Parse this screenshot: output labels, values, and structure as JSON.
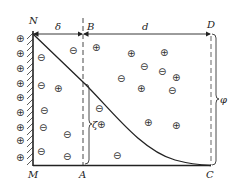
{
  "diagram": {
    "labels": {
      "N": "N",
      "M": "M",
      "A": "A",
      "B": "B",
      "C": "C",
      "D": "D",
      "delta": "δ",
      "d": "d",
      "zeta": "ζ",
      "phi": "φ"
    },
    "symbols": {
      "plus": "⊕",
      "minus": "⊖"
    },
    "colors": {
      "line": "#222222",
      "background": "#ffffff"
    },
    "wall_ions": [
      {
        "x": 20,
        "y": 39
      },
      {
        "x": 20,
        "y": 54
      },
      {
        "x": 20,
        "y": 68
      },
      {
        "x": 20,
        "y": 83
      },
      {
        "x": 20,
        "y": 97
      },
      {
        "x": 20,
        "y": 112
      },
      {
        "x": 20,
        "y": 127
      },
      {
        "x": 20,
        "y": 140
      },
      {
        "x": 20,
        "y": 157
      }
    ],
    "solution_ions": [
      {
        "type": "minus",
        "x": 41,
        "y": 57
      },
      {
        "type": "minus",
        "x": 74,
        "y": 50
      },
      {
        "type": "plus",
        "x": 97,
        "y": 47
      },
      {
        "type": "plus",
        "x": 132,
        "y": 53
      },
      {
        "type": "plus",
        "x": 165,
        "y": 52
      },
      {
        "type": "minus",
        "x": 145,
        "y": 66
      },
      {
        "type": "minus",
        "x": 163,
        "y": 71
      },
      {
        "type": "plus",
        "x": 177,
        "y": 77
      },
      {
        "type": "minus",
        "x": 121,
        "y": 79
      },
      {
        "type": "plus",
        "x": 142,
        "y": 88
      },
      {
        "type": "minus",
        "x": 173,
        "y": 90
      },
      {
        "type": "minus",
        "x": 41,
        "y": 85
      },
      {
        "type": "plus",
        "x": 58,
        "y": 88
      },
      {
        "type": "minus",
        "x": 99,
        "y": 108
      },
      {
        "type": "minus",
        "x": 44,
        "y": 126
      },
      {
        "type": "minus",
        "x": 43,
        "y": 126
      },
      {
        "type": "minus",
        "x": 67,
        "y": 134
      },
      {
        "type": "minus",
        "x": 41,
        "y": 151
      },
      {
        "type": "minus",
        "x": 67,
        "y": 156
      },
      {
        "type": "plus",
        "x": 148,
        "y": 123
      },
      {
        "type": "plus",
        "x": 176,
        "y": 126
      },
      {
        "type": "minus",
        "x": 117,
        "y": 156
      }
    ]
  }
}
